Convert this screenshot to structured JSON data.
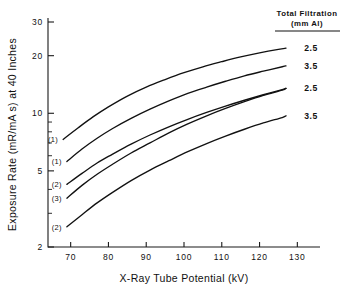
{
  "chart_data": {
    "type": "line",
    "title": "",
    "xlabel": "X-Ray Tube Potential (kV)",
    "ylabel": "Exposure Rate (mR/mA s) at 40 Inches",
    "xlim": [
      64,
      136
    ],
    "ylim": [
      2,
      30
    ],
    "yscale": "log",
    "xscale": "linear",
    "grid": false,
    "legend_position": "right",
    "legend_title_line1": "Total Filtration",
    "legend_title_line2": "(mm Al)",
    "xticks": [
      70,
      80,
      90,
      100,
      110,
      120,
      130
    ],
    "xtick_labels": [
      "70",
      "80",
      "90",
      "100",
      "110",
      "120",
      "130"
    ],
    "yticks": [
      2,
      5,
      10,
      20,
      30
    ],
    "ytick_labels": [
      "2",
      "5",
      "10",
      "20",
      "30"
    ],
    "yminor_ticks": [
      3,
      4,
      6,
      7,
      8,
      9
    ],
    "series": [
      {
        "name": "curve-1",
        "tag": "(1)",
        "filtration": "2.5",
        "x": [
          68,
          72,
          76,
          80,
          85,
          90,
          95,
          100,
          105,
          110,
          115,
          120,
          125,
          127
        ],
        "y": [
          7.3,
          8.4,
          9.6,
          10.8,
          12.3,
          13.7,
          15.0,
          16.3,
          17.5,
          18.6,
          19.7,
          20.7,
          21.6,
          21.9
        ]
      },
      {
        "name": "curve-2",
        "tag": "(1)",
        "filtration": "3.5",
        "x": [
          69,
          73,
          77,
          81,
          86,
          91,
          96,
          101,
          106,
          111,
          116,
          121,
          126,
          127
        ],
        "y": [
          5.6,
          6.5,
          7.4,
          8.3,
          9.4,
          10.5,
          11.6,
          12.7,
          13.7,
          14.7,
          15.7,
          16.6,
          17.5,
          17.7
        ]
      },
      {
        "name": "curve-3",
        "tag": "(2)",
        "filtration": "2.5",
        "x": [
          69,
          73,
          77,
          81,
          86,
          91,
          96,
          101,
          106,
          111,
          116,
          121,
          126,
          127
        ],
        "y": [
          4.25,
          4.85,
          5.5,
          6.1,
          6.9,
          7.7,
          8.5,
          9.3,
          10.1,
          10.9,
          11.7,
          12.5,
          13.3,
          13.5
        ]
      },
      {
        "name": "curve-4",
        "tag": "(3)",
        "filtration": "2.5",
        "x": [
          69,
          73,
          77,
          81,
          86,
          91,
          96,
          101,
          106,
          111,
          116,
          121,
          126,
          127
        ],
        "y": [
          3.6,
          4.2,
          4.8,
          5.4,
          6.2,
          7.0,
          7.9,
          8.8,
          9.7,
          10.6,
          11.5,
          12.4,
          13.2,
          13.5
        ]
      },
      {
        "name": "curve-5",
        "tag": "(2)",
        "filtration": "3.5",
        "x": [
          69,
          73,
          77,
          81,
          86,
          91,
          96,
          101,
          106,
          111,
          116,
          121,
          126,
          127
        ],
        "y": [
          2.55,
          2.95,
          3.4,
          3.85,
          4.45,
          5.05,
          5.65,
          6.3,
          6.95,
          7.6,
          8.25,
          8.9,
          9.5,
          9.7
        ]
      }
    ],
    "curve_tags": [
      "(1)",
      "(1)",
      "(2)",
      "(3)",
      "(2)"
    ],
    "legend_entries": [
      {
        "label": "2.5",
        "series": "curve-1"
      },
      {
        "label": "3.5",
        "series": "curve-2"
      },
      {
        "label": "2.5",
        "series": "curve-3"
      },
      {
        "label": "3.5",
        "series": "curve-5"
      }
    ],
    "colors": {
      "line": "#111111",
      "axis": "#1a1a1a",
      "background": "#ffffff"
    }
  }
}
